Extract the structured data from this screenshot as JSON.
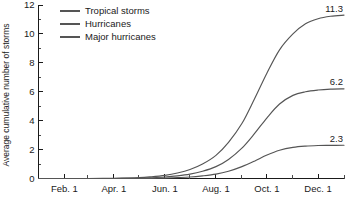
{
  "chart_data": {
    "type": "line",
    "title": "",
    "subtitle": "",
    "xlabel": "",
    "ylabel": "Average cumulative number of storms",
    "xlim": [
      0,
      365
    ],
    "ylim": [
      0,
      12
    ],
    "grid": false,
    "legend_position": "top-left",
    "x_tick_labels": [
      "Feb. 1",
      "Apr. 1",
      "Jun. 1",
      "Aug. 1",
      "Oct. 1",
      "Dec. 1"
    ],
    "x_tick_days": [
      31,
      90,
      151,
      212,
      273,
      334
    ],
    "x_minor_tick_days": [
      0,
      59,
      120,
      181,
      243,
      304,
      365
    ],
    "y_tick_labels": [
      "0",
      "2",
      "4",
      "6",
      "8",
      "10",
      "12"
    ],
    "y_tick_values": [
      0,
      2,
      4,
      6,
      8,
      10,
      12
    ],
    "y_minor_tick_values": [
      1,
      3,
      5,
      7,
      9,
      11
    ],
    "series": [
      {
        "name": "Tropical storms",
        "color": "#555555",
        "end_label": "11.3",
        "final_value": 11.3,
        "points": [
          [
            0,
            0.0
          ],
          [
            31,
            0.0
          ],
          [
            59,
            0.0
          ],
          [
            90,
            0.02
          ],
          [
            120,
            0.06
          ],
          [
            135,
            0.12
          ],
          [
            151,
            0.22
          ],
          [
            166,
            0.38
          ],
          [
            181,
            0.62
          ],
          [
            196,
            1.0
          ],
          [
            212,
            1.6
          ],
          [
            227,
            2.5
          ],
          [
            243,
            3.8
          ],
          [
            258,
            5.5
          ],
          [
            273,
            7.3
          ],
          [
            288,
            8.9
          ],
          [
            304,
            10.0
          ],
          [
            319,
            10.7
          ],
          [
            334,
            11.05
          ],
          [
            349,
            11.22
          ],
          [
            365,
            11.3
          ]
        ]
      },
      {
        "name": "Hurricanes",
        "color": "#555555",
        "end_label": "6.2",
        "final_value": 6.2,
        "points": [
          [
            0,
            0.0
          ],
          [
            31,
            0.0
          ],
          [
            59,
            0.0
          ],
          [
            90,
            0.0
          ],
          [
            120,
            0.02
          ],
          [
            135,
            0.05
          ],
          [
            151,
            0.1
          ],
          [
            166,
            0.18
          ],
          [
            181,
            0.3
          ],
          [
            196,
            0.5
          ],
          [
            212,
            0.82
          ],
          [
            227,
            1.32
          ],
          [
            243,
            2.1
          ],
          [
            258,
            3.1
          ],
          [
            273,
            4.2
          ],
          [
            288,
            5.15
          ],
          [
            304,
            5.75
          ],
          [
            319,
            6.0
          ],
          [
            334,
            6.12
          ],
          [
            349,
            6.18
          ],
          [
            365,
            6.2
          ]
        ]
      },
      {
        "name": "Major hurricanes",
        "color": "#555555",
        "end_label": "2.3",
        "final_value": 2.3,
        "points": [
          [
            0,
            0.0
          ],
          [
            31,
            0.0
          ],
          [
            59,
            0.0
          ],
          [
            90,
            0.0
          ],
          [
            120,
            0.0
          ],
          [
            135,
            0.01
          ],
          [
            151,
            0.03
          ],
          [
            166,
            0.06
          ],
          [
            181,
            0.1
          ],
          [
            196,
            0.18
          ],
          [
            212,
            0.3
          ],
          [
            227,
            0.5
          ],
          [
            243,
            0.82
          ],
          [
            258,
            1.2
          ],
          [
            273,
            1.62
          ],
          [
            288,
            1.95
          ],
          [
            304,
            2.15
          ],
          [
            319,
            2.24
          ],
          [
            334,
            2.28
          ],
          [
            349,
            2.29
          ],
          [
            365,
            2.3
          ]
        ]
      }
    ]
  },
  "legend": {
    "items": [
      {
        "label": "Tropical storms"
      },
      {
        "label": "Hurricanes"
      },
      {
        "label": "Major hurricanes"
      }
    ]
  }
}
